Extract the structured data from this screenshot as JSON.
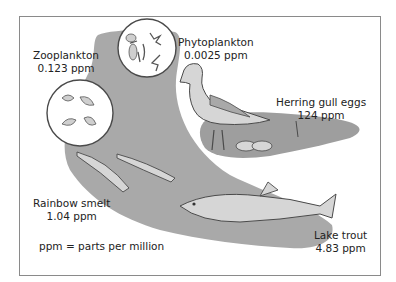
{
  "figure": {
    "type": "biomagnification food chain diagram",
    "colors": {
      "water": "#a9a9a9",
      "water_light": "#b8b8b8",
      "organism_fill": "#d6d6d6",
      "outline": "#4a4a4a",
      "frame": "#8a8a8a",
      "text": "#222222"
    },
    "organisms": [
      {
        "name": "Phytoplankton",
        "value": "0.0025 ppm"
      },
      {
        "name": "Zooplankton",
        "value": "0.123 ppm"
      },
      {
        "name": "Rainbow smelt",
        "value": "1.04 ppm"
      },
      {
        "name": "Lake trout",
        "value": "4.83 ppm"
      },
      {
        "name": "Herring gull eggs",
        "value": "124 ppm"
      }
    ],
    "legend": "ppm = parts per million"
  }
}
